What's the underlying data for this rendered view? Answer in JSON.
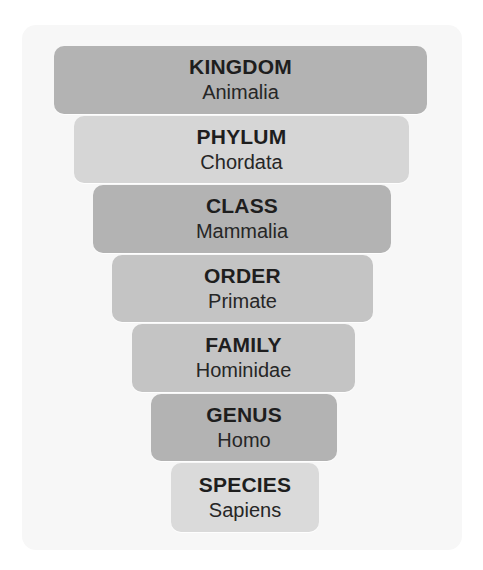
{
  "diagram": {
    "type": "taxonomy-funnel",
    "tiers": [
      {
        "rank": "KINGDOM",
        "name": "Animalia",
        "color": "#b3b3b3",
        "x": 54,
        "y": 45,
        "w": 373,
        "h": 70
      },
      {
        "rank": "PHYLUM",
        "name": "Chordata",
        "color": "#d6d6d6",
        "x": 74,
        "y": 115,
        "w": 335,
        "h": 69
      },
      {
        "rank": "CLASS",
        "name": "Mammalia",
        "color": "#b3b3b3",
        "x": 93,
        "y": 184,
        "w": 298,
        "h": 70
      },
      {
        "rank": "ORDER",
        "name": "Primate",
        "color": "#c4c4c4",
        "x": 112,
        "y": 254,
        "w": 261,
        "h": 69
      },
      {
        "rank": "FAMILY",
        "name": "Hominidae",
        "color": "#c4c4c4",
        "x": 132,
        "y": 323,
        "w": 223,
        "h": 70
      },
      {
        "rank": "GENUS",
        "name": "Homo",
        "color": "#b3b3b3",
        "x": 151,
        "y": 393,
        "w": 186,
        "h": 69
      },
      {
        "rank": "SPECIES",
        "name": "Sapiens",
        "color": "#dadada",
        "x": 171,
        "y": 462,
        "w": 148,
        "h": 71
      }
    ]
  }
}
